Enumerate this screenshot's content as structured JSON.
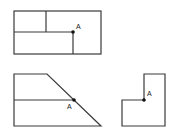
{
  "figures": [
    {
      "id": "rectangle-partition",
      "point_label": "A",
      "outer": {
        "x": 14,
        "y": 11,
        "w": 87,
        "h": 43
      },
      "lines": [
        {
          "x1": 46,
          "y1": 11,
          "x2": 46,
          "y2": 32
        },
        {
          "x1": 14,
          "y1": 32,
          "x2": 73,
          "y2": 32
        },
        {
          "x1": 73,
          "y1": 32,
          "x2": 73,
          "y2": 54
        }
      ],
      "point": {
        "x": 73,
        "y": 32
      },
      "label_pos": {
        "x": 76,
        "y": 29
      }
    },
    {
      "id": "trapezoid-partition",
      "point_label": "A",
      "polygon": "14,74 47,74 101,126 14,126",
      "lines": [
        {
          "x1": 14,
          "y1": 100,
          "x2": 74,
          "y2": 100
        }
      ],
      "point": {
        "x": 74,
        "y": 100
      },
      "label_pos": {
        "x": 67,
        "y": 109
      }
    },
    {
      "id": "l-shape",
      "point_label": "A",
      "polygon": "144,74 165,74 165,126 122,126 122,100 144,100",
      "lines": [],
      "point": {
        "x": 144,
        "y": 100
      },
      "label_pos": {
        "x": 147,
        "y": 96
      }
    }
  ],
  "colors": {
    "stroke": "#3a3a3a",
    "point": "#111111",
    "background": "#ffffff"
  }
}
